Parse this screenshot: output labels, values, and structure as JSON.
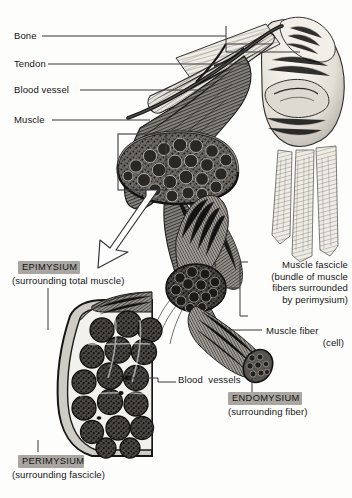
{
  "figure": {
    "background_color": "#fdfdfc",
    "ink_color": "#141414",
    "highlight_color": "#a9a6a1"
  },
  "labels": {
    "bone": "Bone",
    "tendon": "Tendon",
    "blood_vessel": "Blood vessel",
    "muscle": "Muscle",
    "epimysium_title": "EPIMYSIUM",
    "epimysium_sub": "(surrounding total muscle)",
    "perimysium_title": "PERIMYSIUM",
    "perimysium_sub": "(surrounding fascicle)",
    "endomysium_title": "ENDOMYSIUM",
    "endomysium_sub": "(surrounding fiber)",
    "blood_vessels": "Blood  vessels",
    "muscle_fascicle": "Muscle fascicle\n(bundle of muscle\nfibers surrounded\nby perimysium)",
    "muscle_fiber": "Muscle fiber",
    "muscle_fiber_sub": "(cell)"
  },
  "callouts": {
    "magnifier_box": "cross-section-selection-box",
    "magnifier_arrow": "magnify-arrow",
    "bone_bracket": "bone-leader-bracket",
    "fascicle_bracket": "fascicle-leader-bracket"
  }
}
